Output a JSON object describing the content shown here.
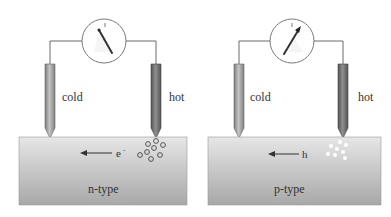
{
  "diagram": {
    "panels": [
      {
        "id": "n-type",
        "cold_label": "cold",
        "hot_label": "hot",
        "carrier_label": "e",
        "carrier_superscript": "-",
        "material_label": "n-type",
        "meter_needle": "deflects left",
        "carrier_style": "hollow circles"
      },
      {
        "id": "p-type",
        "cold_label": "cold",
        "hot_label": "hot",
        "carrier_label": "h",
        "carrier_superscript": "",
        "material_label": "p-type",
        "meter_needle": "deflects right",
        "carrier_style": "filled white dots"
      }
    ],
    "colors": {
      "block_top": "#e4e4e4",
      "block_bottom": "#a9a9a9",
      "cold_probe": "#9a9a9a",
      "hot_probe": "#6e6e6e",
      "wire": "#6a6a6a",
      "needle": "#333333"
    }
  }
}
